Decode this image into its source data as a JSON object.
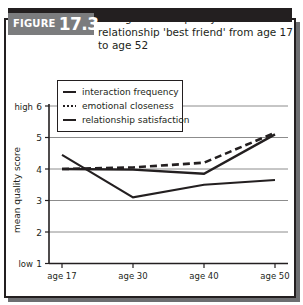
{
  "figure": {
    "tag_word": "FIGURE",
    "tag_number": "17.3",
    "title": "Changes in the quality* of the social relationship 'best friend' from age 17 to age 52"
  },
  "legend": {
    "items": [
      {
        "label": "interaction frequency",
        "style": "solid"
      },
      {
        "label": "emotional closeness",
        "style": "dotted"
      },
      {
        "label": "relationship satisfaction",
        "style": "solid"
      }
    ]
  },
  "axis": {
    "y_title": "mean quality score",
    "y_low_label": "low",
    "y_high_label": "high",
    "y_ticks": [
      "6",
      "5",
      "4",
      "3",
      "2",
      "1"
    ]
  },
  "chart_data": {
    "type": "line",
    "title": "Changes in the quality* of the social relationship 'best friend' from age 17 to age 52",
    "xlabel": "",
    "ylabel": "mean quality score",
    "categories": [
      "age 17",
      "age 30",
      "age 40",
      "age 50"
    ],
    "ylim": [
      1,
      6
    ],
    "yticks": [
      1,
      2,
      3,
      4,
      5,
      6
    ],
    "ytick_annotations": {
      "1": "low",
      "6": "high"
    },
    "grid": "horizontal",
    "legend_position": "upper-left-inside",
    "series": [
      {
        "name": "interaction frequency",
        "style": "solid",
        "values": [
          4.0,
          3.98,
          3.85,
          5.1
        ]
      },
      {
        "name": "emotional closeness",
        "style": "dotted",
        "values": [
          4.0,
          4.05,
          4.2,
          5.15
        ]
      },
      {
        "name": "relationship satisfaction",
        "style": "solid",
        "values": [
          4.45,
          3.1,
          3.5,
          3.65
        ]
      }
    ]
  },
  "colors": {
    "ink": "#231f20",
    "grid": "#8c8c8c",
    "tag_fill": "#7b7c7e",
    "shadow": "#6d6e71",
    "paper": "#ffffff"
  }
}
